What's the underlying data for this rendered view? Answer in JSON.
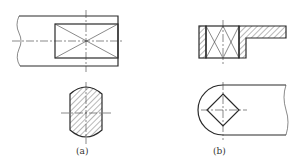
{
  "figures": [
    {
      "id": "a",
      "label": "(a)",
      "description": "flat shaft end with square section marked by diagonal crosses; section view below"
    },
    {
      "id": "b",
      "label": "(b)",
      "description": "stepped part with square hole in section; rounded end view below"
    }
  ],
  "colors": {
    "line": "#2a2a2a",
    "background": "#ffffff"
  }
}
